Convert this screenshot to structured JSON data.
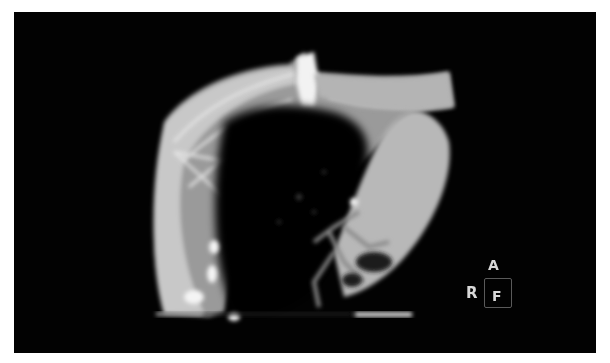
{
  "image": {
    "type": "CT scan",
    "background_color": "#020202",
    "frame_color": "#ffffff"
  },
  "orientation_marker": {
    "anterior_label": "A",
    "right_label": "R",
    "foot_label": "F"
  },
  "scale_bar": {
    "color": "#cfcfcf"
  }
}
